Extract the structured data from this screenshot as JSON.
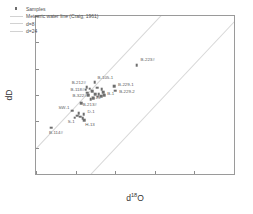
{
  "chart_data": {
    "type": "scatter",
    "title": "",
    "xlabel": "d 18O",
    "ylabel": "dD",
    "xlim": [
      -13,
      -8
    ],
    "ylim": [
      -85,
      -55
    ],
    "xticks": [
      -13,
      -12,
      -11,
      -10,
      -9,
      -8
    ],
    "yticks": [
      -85,
      -80,
      -75,
      -70,
      -65,
      -60,
      -55
    ],
    "xtick_labels": [
      "-13",
      "-12",
      "-11",
      "-10",
      "-9",
      "-8"
    ],
    "ytick_labels": [
      "-85",
      "-80",
      "-75",
      "-70",
      "-65",
      "-60",
      "-55"
    ],
    "grid": false,
    "legend_position": "top-left",
    "series": [
      {
        "name": "Samples",
        "marker": "square",
        "color": "#6e6e6e",
        "points": [
          {
            "label": "B-223#",
            "x": -10.46,
            "y": -64.3,
            "lx": 4,
            "ly": -5
          },
          {
            "label": "B-105-1",
            "x": -11.52,
            "y": -67.6,
            "lx": 3,
            "ly": -4
          },
          {
            "label": "B-229-1",
            "x": -11.03,
            "y": -68.3,
            "lx": 4,
            "ly": -1
          },
          {
            "label": "B-229-2",
            "x": -11.0,
            "y": -69.2,
            "lx": 4,
            "ly": 1
          },
          {
            "label": "B-212#",
            "x": -11.72,
            "y": -68.5,
            "lx": -15,
            "ly": -4
          },
          {
            "label": "B-118#",
            "x": -11.75,
            "y": -69.0,
            "lx": -15,
            "ly": 0
          },
          {
            "label": "B-322#",
            "x": -11.7,
            "y": -69.6,
            "lx": -15,
            "ly": 3
          },
          {
            "label": "B-213#",
            "x": -11.62,
            "y": -70.8,
            "lx": -8,
            "ly": 6
          },
          {
            "label": "B-1",
            "x": -11.3,
            "y": -69.5,
            "lx": 4,
            "ly": 2
          },
          {
            "label": "Y-13",
            "x": -11.42,
            "y": -69.9,
            "lx": -7,
            "ly": 4
          },
          {
            "label": "SW-1",
            "x": -12.08,
            "y": -73.0,
            "lx": -14,
            "ly": -3
          },
          {
            "label": "D-1",
            "x": -11.8,
            "y": -73.6,
            "lx": 4,
            "ly": -2
          },
          {
            "label": "S-1",
            "x": -12.02,
            "y": -74.3,
            "lx": -7,
            "ly": 4
          },
          {
            "label": "H-13",
            "x": -11.78,
            "y": -74.8,
            "lx": 1,
            "ly": 5
          },
          {
            "label": "B-114#",
            "x": -12.62,
            "y": -76.2,
            "lx": -2,
            "ly": 5
          },
          {
            "label": "",
            "x": -11.64,
            "y": -68.8,
            "lx": 0,
            "ly": 0
          },
          {
            "label": "",
            "x": -11.58,
            "y": -69.3,
            "lx": 0,
            "ly": 0
          },
          {
            "label": "",
            "x": -11.5,
            "y": -69.8,
            "lx": 0,
            "ly": 0
          },
          {
            "label": "",
            "x": -11.44,
            "y": -70.3,
            "lx": 0,
            "ly": 0
          },
          {
            "label": "",
            "x": -11.36,
            "y": -70.2,
            "lx": 0,
            "ly": 0
          },
          {
            "label": "",
            "x": -11.28,
            "y": -70.0,
            "lx": 0,
            "ly": 0
          },
          {
            "label": "",
            "x": -11.34,
            "y": -68.9,
            "lx": 0,
            "ly": 0
          },
          {
            "label": "",
            "x": -11.46,
            "y": -68.6,
            "lx": 0,
            "ly": 0
          },
          {
            "label": "",
            "x": -11.68,
            "y": -70.0,
            "lx": 0,
            "ly": 0
          },
          {
            "label": "",
            "x": -11.86,
            "y": -71.6,
            "lx": 0,
            "ly": 0
          },
          {
            "label": "",
            "x": -11.92,
            "y": -73.4,
            "lx": 0,
            "ly": 0
          },
          {
            "label": "",
            "x": -11.96,
            "y": -73.9,
            "lx": 0,
            "ly": 0
          },
          {
            "label": "",
            "x": -11.88,
            "y": -74.1,
            "lx": 0,
            "ly": 0
          },
          {
            "label": "",
            "x": -11.82,
            "y": -74.4,
            "lx": 0,
            "ly": 0
          },
          {
            "label": "",
            "x": -11.56,
            "y": -70.6,
            "lx": 0,
            "ly": 0
          }
        ]
      }
    ],
    "reference_lines": [
      {
        "name": "d=8",
        "slope": 8,
        "intercept": 8,
        "color": "#d7d7d7"
      },
      {
        "name": "d=24",
        "slope": 8,
        "intercept": 24,
        "color": "#d7d7d7"
      }
    ]
  },
  "legend": {
    "items": [
      {
        "label": "Samples",
        "key": "marker"
      },
      {
        "label": "Meteoric water line (Craig, 1961)",
        "key": "line"
      },
      {
        "label": "d=8",
        "key": "line"
      },
      {
        "label": "d=24",
        "key": "line"
      }
    ]
  },
  "axis_titles": {
    "x_prefix": "d",
    "x_sup": "18",
    "x_suffix": "O",
    "y": "dD"
  }
}
